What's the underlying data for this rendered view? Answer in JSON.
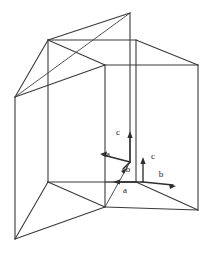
{
  "figure": {
    "background_color": "#ffffff",
    "line_color": "#3a3a3a",
    "vector_color": "#2e2e2e",
    "label_color": "#1c1c1c",
    "width": 212,
    "height": 254,
    "labels": [
      {
        "id": "c-upper",
        "text": "c",
        "x": 118,
        "y": 133
      },
      {
        "id": "a-left",
        "text": "a",
        "x": 108,
        "y": 155
      },
      {
        "id": "b-inner",
        "text": "b",
        "x": 128,
        "y": 170
      },
      {
        "id": "c-right",
        "text": "c",
        "x": 153,
        "y": 157
      },
      {
        "id": "b-right",
        "text": "b",
        "x": 161,
        "y": 175
      },
      {
        "id": "a-bottom",
        "text": "a",
        "x": 125,
        "y": 191
      }
    ],
    "vertices": {
      "top_apex": [
        130,
        13
      ],
      "upper_left": [
        48,
        40
      ],
      "upper_inner": [
        105,
        65
      ],
      "upper_right_back": [
        136,
        40
      ],
      "far_left": [
        15,
        97
      ],
      "far_right": [
        198,
        65
      ],
      "mid_left": [
        48,
        182
      ],
      "mid_center": [
        105,
        207
      ],
      "bottom_left": [
        15,
        239
      ],
      "bottom_right": [
        198,
        210
      ],
      "right_inner": [
        136,
        182
      ]
    },
    "vectors": [
      {
        "id": "vec-c-up",
        "from": [
          130,
          162
        ],
        "to": [
          130,
          131
        ],
        "label": "c"
      },
      {
        "id": "vec-a-left",
        "from": [
          130,
          162
        ],
        "to": [
          100,
          154
        ],
        "label": "a"
      },
      {
        "id": "vec-b-in",
        "from": [
          130,
          162
        ],
        "to": [
          121,
          170
        ],
        "label": "b"
      },
      {
        "id": "vec-c-r",
        "from": [
          143,
          182
        ],
        "to": [
          143,
          157
        ],
        "label": "c"
      },
      {
        "id": "vec-b-r",
        "from": [
          143,
          182
        ],
        "to": [
          176,
          186
        ],
        "label": "b"
      },
      {
        "id": "vec-a-b",
        "from": [
          143,
          182
        ],
        "to": [
          113,
          182
        ],
        "label": "a"
      }
    ]
  }
}
